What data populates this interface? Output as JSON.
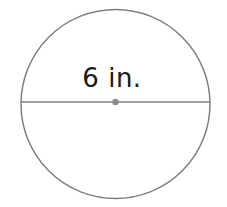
{
  "figure": {
    "name": "circle-with-diameter",
    "canvas": {
      "width": 227,
      "height": 207,
      "background": "#ffffff"
    },
    "circle": {
      "cx": 115.5,
      "cy": 104,
      "r": 94.5,
      "stroke_color": "#7f7f7f",
      "stroke_width": 1.5,
      "fill": "none"
    },
    "diameter_segment": {
      "x1": 21,
      "y1": 102,
      "x2": 210,
      "y2": 102,
      "stroke_color": "#7f7f7f",
      "stroke_width": 1.4
    },
    "center_point": {
      "cx": 115.5,
      "cy": 102,
      "r": 3.2,
      "fill": "#8a8a8a"
    },
    "label": {
      "text": "6 in.",
      "value": "6",
      "unit": "in.",
      "measures": "diameter",
      "x": 112,
      "y": 87,
      "font_size": 26,
      "color": "#1a1a1a",
      "anchor": "middle"
    }
  }
}
